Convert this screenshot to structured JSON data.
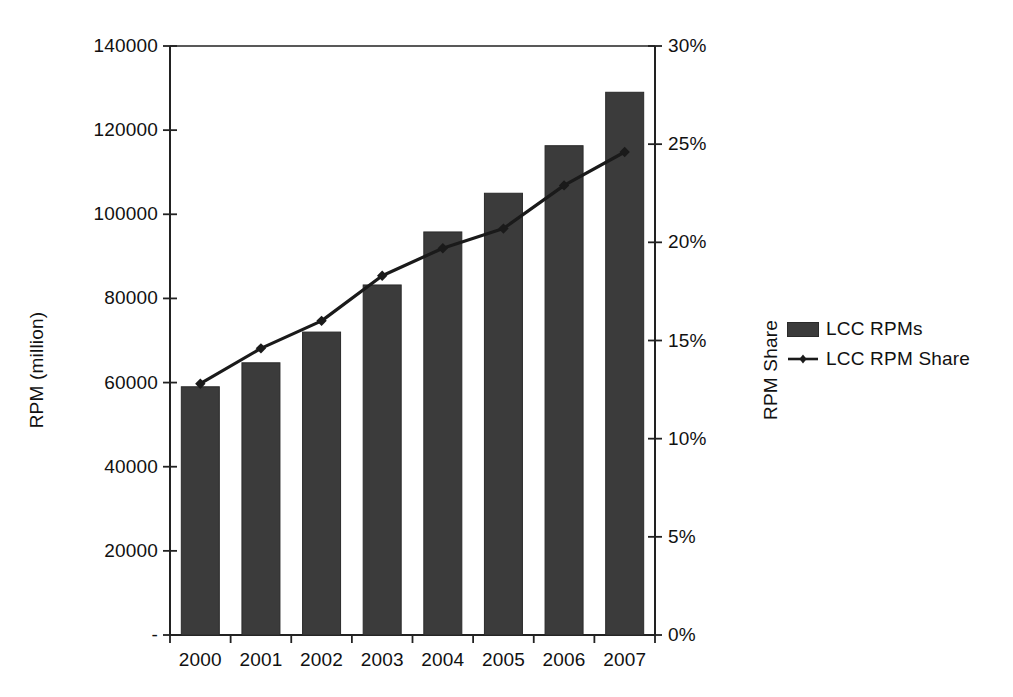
{
  "chart_data": {
    "type": "bar",
    "title": "",
    "subtitle": "",
    "categories": [
      "2000",
      "2001",
      "2002",
      "2003",
      "2004",
      "2005",
      "2006",
      "2007"
    ],
    "xlabel": "",
    "ylabel": "RPM (million)",
    "y2label": "RPM Share",
    "ylim": [
      0,
      140000
    ],
    "y2lim": [
      0,
      30
    ],
    "grid": false,
    "legend_position": "right",
    "series": [
      {
        "name": "LCC RPMs",
        "kind": "bar",
        "axis": "left",
        "color": "#3b3b3b",
        "values": [
          59000,
          64700,
          72000,
          83200,
          95800,
          105000,
          116300,
          129000
        ]
      },
      {
        "name": "LCC RPM Share",
        "kind": "line",
        "axis": "right",
        "color": "#1a1a1a",
        "marker": "diamond",
        "values": [
          12.8,
          14.6,
          16.0,
          18.3,
          19.7,
          20.7,
          22.9,
          24.6
        ]
      }
    ],
    "yticks": [
      {
        "value": 0,
        "label": "-"
      },
      {
        "value": 20000,
        "label": "20000"
      },
      {
        "value": 40000,
        "label": "40000"
      },
      {
        "value": 60000,
        "label": "60000"
      },
      {
        "value": 80000,
        "label": "80000"
      },
      {
        "value": 100000,
        "label": "100000"
      },
      {
        "value": 120000,
        "label": "120000"
      },
      {
        "value": 140000,
        "label": "140000"
      }
    ],
    "y2ticks": [
      {
        "value": 0,
        "label": "0%"
      },
      {
        "value": 5,
        "label": "5%"
      },
      {
        "value": 10,
        "label": "10%"
      },
      {
        "value": 15,
        "label": "15%"
      },
      {
        "value": 20,
        "label": "20%"
      },
      {
        "value": 25,
        "label": "25%"
      },
      {
        "value": 30,
        "label": "30%"
      }
    ]
  },
  "axes": {
    "left_title": "RPM (million)",
    "right_title": "RPM Share"
  },
  "legend": {
    "items": [
      {
        "label": "LCC RPMs"
      },
      {
        "label": "LCC RPM Share"
      }
    ]
  }
}
